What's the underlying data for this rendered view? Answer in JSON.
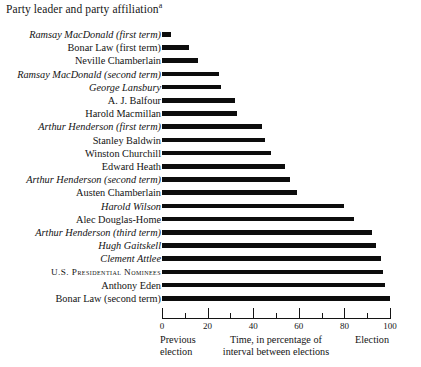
{
  "chart_data": {
    "type": "bar",
    "orientation": "horizontal",
    "title": "Party leader and party affiliation",
    "title_superscript": "a",
    "xlabel": "Time, in percentage of interval between elections",
    "ylabel": "",
    "xlim": [
      0,
      100
    ],
    "grid": false,
    "legend": null,
    "axis": {
      "major_ticks": [
        0,
        20,
        40,
        60,
        80,
        100
      ],
      "minor_ticks": [
        10,
        30,
        50,
        70,
        90
      ],
      "tick_labels": [
        "0",
        "20",
        "40",
        "60",
        "80",
        "100"
      ],
      "left_endpoint_label_line1": "Previous",
      "left_endpoint_label_line2": "election",
      "right_endpoint_label": "Election",
      "center_label_line1": "Time, in percentage of",
      "center_label_line2": "interval between elections"
    },
    "categories": [
      "Ramsay MacDonald  (first term)",
      "Bonar Law (first term)",
      "Neville Chamberlain",
      "Ramsay MacDonald  (second term)",
      "George Lansbury",
      "A. J. Balfour",
      "Harold Macmillan",
      "Arthur Henderson  (first term)",
      "Stanley Baldwin",
      "Winston Churchill",
      "Edward Heath",
      "Arthur Henderson  (second term)",
      "Austen Chamberlain",
      "Harold Wilson",
      "Alec Douglas-Home",
      "Arthur Henderson  (third term)",
      "Hugh Gaitskell",
      "Clement Attlee",
      "U.S. Presidential Nominees",
      "Anthony Eden",
      "Bonar Law (second term)"
    ],
    "values": [
      4,
      12,
      16,
      25,
      26,
      32,
      33,
      44,
      45,
      48,
      54,
      56,
      59,
      80,
      84,
      92,
      94,
      96,
      97,
      98,
      100
    ],
    "label_styles": [
      "italic",
      "roman",
      "roman",
      "italic",
      "italic",
      "roman",
      "roman",
      "italic",
      "roman",
      "roman",
      "roman",
      "italic",
      "roman",
      "italic",
      "roman",
      "italic",
      "italic",
      "italic",
      "smallcaps",
      "roman",
      "roman"
    ],
    "bar_color": "#0d0d0d",
    "background_color": "#ffffff"
  }
}
